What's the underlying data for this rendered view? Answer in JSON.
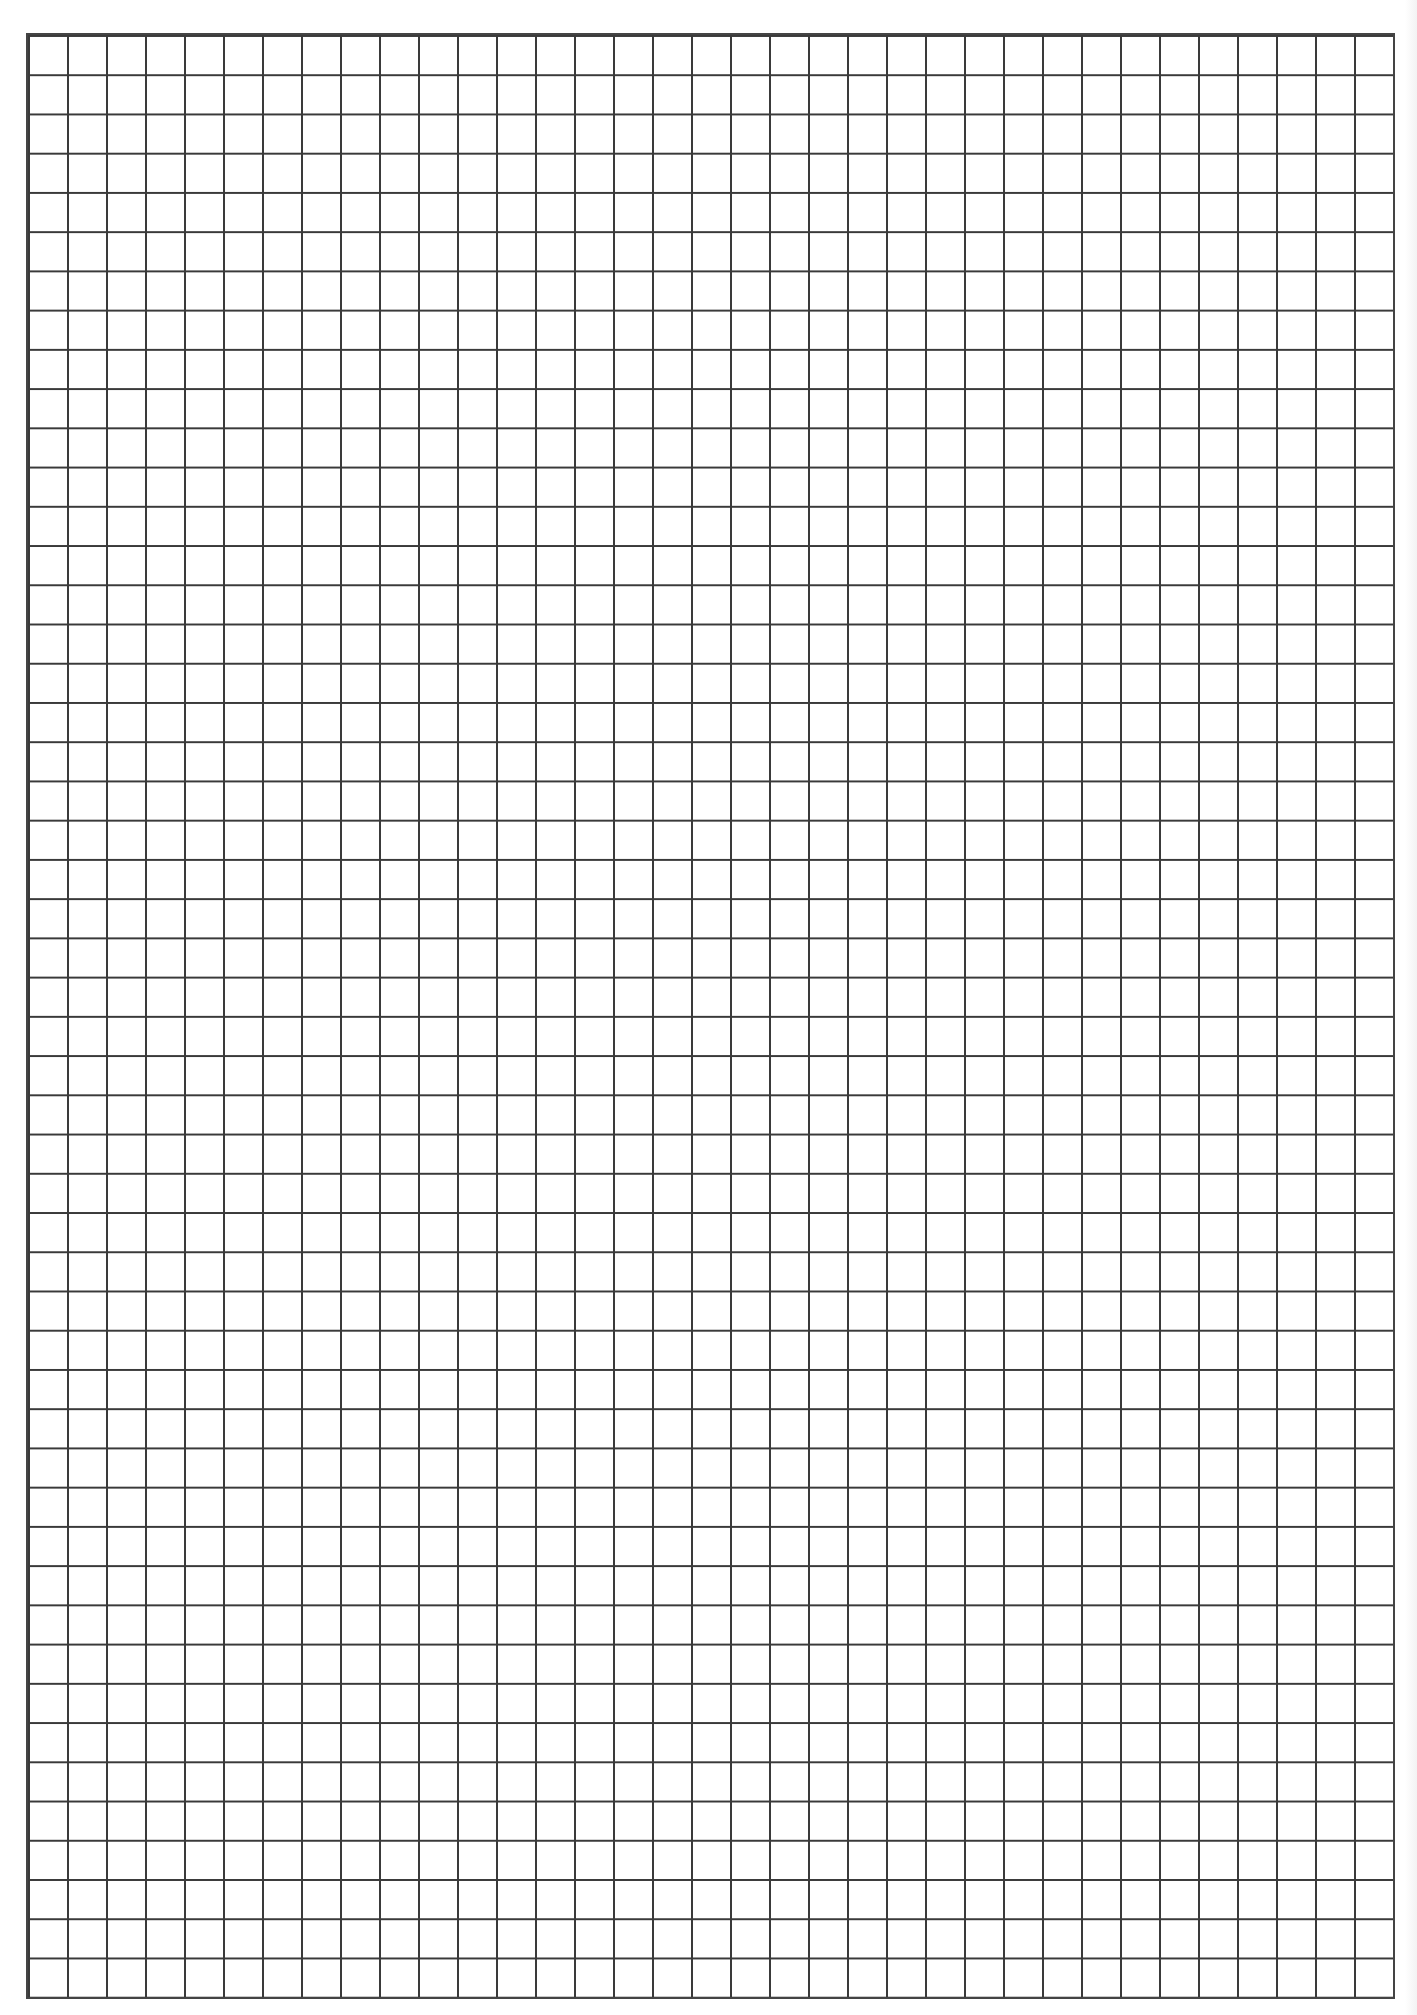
{
  "page": {
    "type": "grid-paper",
    "background_color": "#ffffff",
    "line_color": "#3a3a3a",
    "columns": 35,
    "rows": 50
  }
}
